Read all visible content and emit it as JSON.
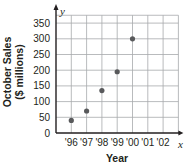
{
  "chart_data": {
    "type": "scatter",
    "title": "",
    "xlabel": "Year",
    "ylabel_line1": "October Sales",
    "ylabel_line2": "($ millions)",
    "x_axis_var": "x",
    "y_axis_var": "y",
    "categories": [
      "'96",
      "'97",
      "'98",
      "'99",
      "'00",
      "'01",
      "'02"
    ],
    "y_ticks": [
      0,
      50,
      100,
      150,
      200,
      250,
      300,
      350
    ],
    "ylim": [
      0,
      375
    ],
    "grid": true,
    "legend": null,
    "points": [
      {
        "x": "'96",
        "y": 40
      },
      {
        "x": "'97",
        "y": 70
      },
      {
        "x": "'98",
        "y": 135
      },
      {
        "x": "'99",
        "y": 195
      },
      {
        "x": "'00",
        "y": 300
      }
    ],
    "colors": {
      "point": "#58595b",
      "grid": "#a7a9ac",
      "axis": "#231f20"
    }
  }
}
